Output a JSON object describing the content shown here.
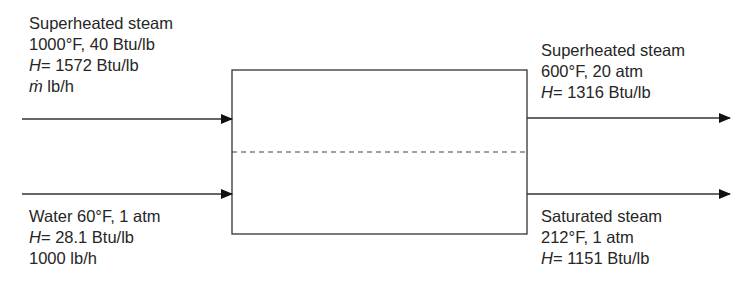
{
  "colors": {
    "line": "#333333",
    "text": "#262626",
    "background": "#ffffff"
  },
  "unit": {
    "name": "process-unit",
    "divider": "dashed"
  },
  "streams": {
    "inlet_top": {
      "line1": "Superheated steam",
      "line2": "1000°F, 40 Btu/lb",
      "h_symbol": "H",
      "h_value": "= 1572 Btu/lb",
      "flow_symbol": "ṁ",
      "flow_value": " lb/h"
    },
    "inlet_bottom": {
      "line1": "Water 60°F, 1 atm",
      "h_symbol": "H",
      "h_value": "= 28.1 Btu/lb",
      "line3": "1000 lb/h"
    },
    "outlet_top": {
      "line1": "Superheated steam",
      "line2": "600°F, 20 atm",
      "h_symbol": "H",
      "h_value": "= 1316 Btu/lb"
    },
    "outlet_bottom": {
      "line1": "Saturated steam",
      "line2": "212°F, 1 atm",
      "h_symbol": "H",
      "h_value": "= 1151 Btu/lb"
    }
  }
}
